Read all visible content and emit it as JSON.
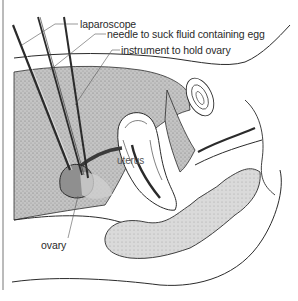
{
  "figure": {
    "type": "anatomical-illustration",
    "colors": {
      "line": "#2b2b2b",
      "stipple_dark": "#b9b9b9",
      "stipple_light": "#d6d6d6",
      "tissue_white": "#ffffff",
      "ovary_fill": "#8f8f8f"
    }
  },
  "labels": {
    "laparoscope": "laparoscope",
    "needle": "needle to suck fluid containing egg",
    "instrument": "instrument to hold ovary",
    "uterus": "uterus",
    "ovary": "ovary"
  },
  "instruments": [
    {
      "name": "laparoscope",
      "label_ref": "labels.laparoscope"
    },
    {
      "name": "needle",
      "label_ref": "labels.needle"
    },
    {
      "name": "holding-instrument",
      "label_ref": "labels.instrument"
    }
  ]
}
